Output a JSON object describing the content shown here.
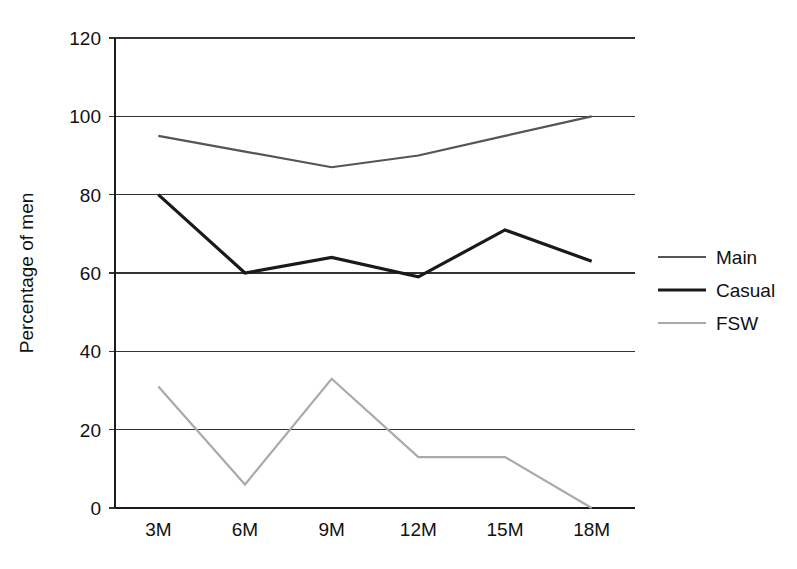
{
  "chart_data": {
    "type": "line",
    "title": "",
    "subtitle": "",
    "xlabel": "",
    "ylabel": "Percentage of men",
    "categories": [
      "3M",
      "6M",
      "9M",
      "12M",
      "15M",
      "18M"
    ],
    "x_tick_labels": [
      "3M",
      "6M",
      "9M",
      "12M",
      "15M",
      "18M"
    ],
    "y_tick_labels": [
      "0",
      "20",
      "40",
      "60",
      "80",
      "100",
      "120"
    ],
    "y_ticks": [
      0,
      20,
      40,
      60,
      80,
      100,
      120
    ],
    "ylim": [
      0,
      120
    ],
    "grid": "horizontal",
    "legend_position": "right",
    "series": [
      {
        "name": "Main",
        "color": "#555555",
        "values": [
          95,
          91,
          87,
          90,
          95,
          100
        ]
      },
      {
        "name": "Casual",
        "color": "#1a1a1a",
        "values": [
          80,
          60,
          64,
          59,
          71,
          63
        ]
      },
      {
        "name": "FSW",
        "color": "#aaaaaa",
        "values": [
          31,
          6,
          33,
          13,
          13,
          0
        ]
      }
    ]
  },
  "legend": {
    "entries": [
      {
        "label": "Main"
      },
      {
        "label": "Casual"
      },
      {
        "label": "FSW"
      }
    ]
  },
  "axes": {
    "y_title": "Percentage of men"
  }
}
